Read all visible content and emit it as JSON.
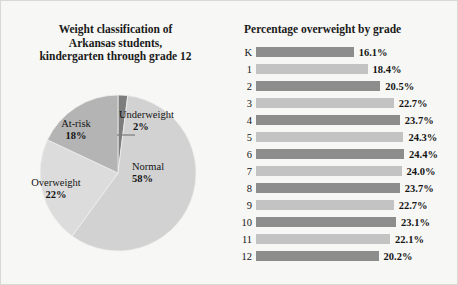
{
  "figure": {
    "background": "#f7f7f5",
    "border_color": "#d8d8d4"
  },
  "pie_panel": {
    "title_line1": "Weight classification of",
    "title_line2": "Arkansas students,",
    "title_line3": "kindergarten through grade 12",
    "labels": {
      "underweight_name": "Underweight",
      "underweight_pct": "2%",
      "normal_name": "Normal",
      "normal_pct": "58%",
      "overweight_name": "Overweight",
      "overweight_pct": "22%",
      "atrisk_name": "At-risk",
      "atrisk_pct": "18%"
    }
  },
  "bar_panel": {
    "title": "Percentage overweight by grade"
  },
  "chart_data": [
    {
      "type": "pie",
      "title": "Weight classification of Arkansas students, kindergarten through grade 12",
      "categories": [
        "Underweight",
        "Normal",
        "Overweight",
        "At-risk"
      ],
      "values": [
        2,
        58,
        22,
        18
      ],
      "value_labels": [
        "2%",
        "58%",
        "22%",
        "18%"
      ],
      "colors": [
        "#7d7d7d",
        "#d2d2d2",
        "#dcdcdc",
        "#b4b4b4"
      ],
      "start_angle_deg": 0,
      "direction": "clockwise",
      "legend": "none",
      "units": "percent"
    },
    {
      "type": "bar",
      "orientation": "horizontal",
      "title": "Percentage overweight by grade",
      "xlabel": "",
      "ylabel": "",
      "grid": false,
      "legend": "none",
      "units": "percent",
      "xlim": [
        0,
        24.4
      ],
      "categories": [
        "K",
        "1",
        "2",
        "3",
        "4",
        "5",
        "6",
        "7",
        "8",
        "9",
        "10",
        "11",
        "12"
      ],
      "values": [
        16.1,
        18.4,
        20.5,
        22.7,
        23.7,
        24.3,
        24.4,
        24.0,
        23.7,
        22.7,
        23.1,
        22.1,
        20.2
      ],
      "value_labels": [
        "16.1%",
        "18.4%",
        "20.5%",
        "22.7%",
        "23.7%",
        "24.3%",
        "24.4%",
        "24.0%",
        "23.7%",
        "22.7%",
        "23.1%",
        "22.1%",
        "20.2%"
      ],
      "bar_colors": [
        "dark",
        "light",
        "dark",
        "light",
        "dark",
        "light",
        "dark",
        "light",
        "dark",
        "light",
        "dark",
        "light",
        "dark"
      ],
      "color_dark": "#8d8d8d",
      "color_light": "#c3c3c3"
    }
  ]
}
